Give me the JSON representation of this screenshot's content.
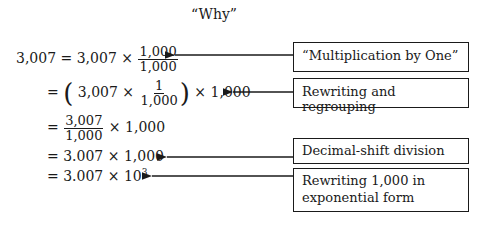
{
  "title": "“Why”",
  "steps": [
    {
      "lhs": "3,007 = 3,007 ×",
      "frac_num": "1,000",
      "frac_den": "1,000"
    },
    {
      "prefix": "= ",
      "open_paren": "(",
      "inner": "3,007 ×",
      "frac_num": "1",
      "frac_den": "1,000",
      "close_paren": ")",
      "suffix": "× 1,000"
    },
    {
      "prefix": "=",
      "frac_num": "3,007",
      "frac_den": "1,000",
      "suffix": "× 1,000"
    },
    {
      "text": "= 3.007 × 1,000"
    },
    {
      "text": "= 3.007 × 10",
      "exponent": "3"
    }
  ],
  "annotations": [
    {
      "label": "“Multiplication by One”"
    },
    {
      "label": "Rewriting and regrouping"
    },
    {
      "label": "Decimal-shift division"
    },
    {
      "label": "Rewriting 1,000 in exponential form"
    }
  ]
}
